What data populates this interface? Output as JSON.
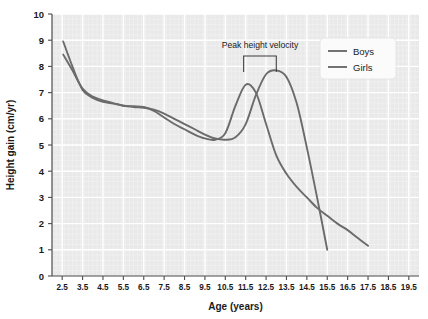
{
  "chart_data": {
    "type": "line",
    "title": "",
    "xlabel": "Age (years)",
    "ylabel": "Height gain (cm/yr)",
    "xlim": [
      2.0,
      20.0
    ],
    "ylim": [
      0,
      10
    ],
    "xticks": [
      2.5,
      3.5,
      4.5,
      5.5,
      6.5,
      7.5,
      8.5,
      9.5,
      10.5,
      11.5,
      12.5,
      13.5,
      14.5,
      15.5,
      16.5,
      17.5,
      18.5,
      19.5
    ],
    "xtick_labels": [
      "2.5",
      "3.5",
      "4.5",
      "5.5",
      "6.5",
      "7.5",
      "8.5",
      "9.5",
      "10.5",
      "11.5",
      "12.5",
      "13.5",
      "14.5",
      "15.5",
      "16.5",
      "17.5",
      "18.5",
      "19.5"
    ],
    "yticks": [
      0,
      1,
      2,
      3,
      4,
      5,
      6,
      7,
      8,
      9,
      10
    ],
    "ytick_labels": [
      "0",
      "1",
      "2",
      "3",
      "4",
      "5",
      "6",
      "7",
      "8",
      "9",
      "10"
    ],
    "grid": true,
    "legend_position": "top-right",
    "plot_background": "#e9e9e9",
    "gridline_color": "#ffffff",
    "line_color": "#6b6b6b",
    "series": [
      {
        "name": "Boys",
        "color": "#6b6b6b",
        "x": [
          2.55,
          3.0,
          3.5,
          4.0,
          4.5,
          5.0,
          5.5,
          6.0,
          6.5,
          7.0,
          7.5,
          8.0,
          8.5,
          9.0,
          9.5,
          10.0,
          10.5,
          11.0,
          11.5,
          12.0,
          12.5,
          13.0,
          13.5,
          14.0,
          14.5,
          15.0,
          15.5
        ],
        "y": [
          8.45,
          7.85,
          7.15,
          6.85,
          6.7,
          6.6,
          6.5,
          6.45,
          6.42,
          6.35,
          6.2,
          6.0,
          5.8,
          5.6,
          5.4,
          5.25,
          5.2,
          5.3,
          5.8,
          6.9,
          7.7,
          7.85,
          7.6,
          6.6,
          4.9,
          3.0,
          1.0
        ]
      },
      {
        "name": "Girls",
        "color": "#6b6b6b",
        "x": [
          2.55,
          3.0,
          3.5,
          4.0,
          4.5,
          5.0,
          5.5,
          6.0,
          6.5,
          7.0,
          7.5,
          8.0,
          8.5,
          9.0,
          9.5,
          10.0,
          10.5,
          11.0,
          11.5,
          12.0,
          12.5,
          13.0,
          13.5,
          14.0,
          14.5,
          15.0,
          15.5,
          16.0,
          16.5,
          17.0,
          17.5
        ],
        "y": [
          8.95,
          8.0,
          7.1,
          6.8,
          6.65,
          6.58,
          6.5,
          6.48,
          6.45,
          6.3,
          6.05,
          5.8,
          5.6,
          5.4,
          5.25,
          5.2,
          5.45,
          6.5,
          7.3,
          7.0,
          5.8,
          4.6,
          3.9,
          3.4,
          3.0,
          2.6,
          2.3,
          2.0,
          1.75,
          1.45,
          1.15
        ]
      }
    ],
    "annotations": [
      {
        "text": "Peak height velocity",
        "type": "bracket",
        "bracket_x_start": 11.4,
        "bracket_x_end": 13.0,
        "bracket_y": 8.4
      }
    ],
    "legend_entries": [
      "Boys",
      "Girls"
    ]
  }
}
